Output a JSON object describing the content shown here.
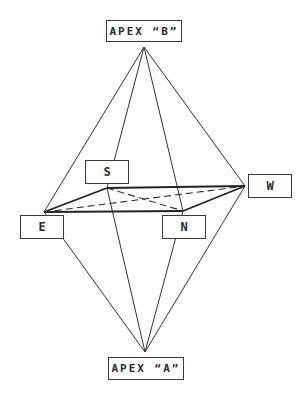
{
  "diagram": {
    "type": "octahedron-bipyramid",
    "line_color": "#333333",
    "apexes": {
      "top": {
        "label": "APEX “B”",
        "point": [
          144,
          47
        ]
      },
      "bottom": {
        "label": "APEX “A”",
        "point": [
          145,
          352
        ]
      }
    },
    "vertices": {
      "S": {
        "label": "S",
        "point": [
          107,
          188
        ]
      },
      "E": {
        "label": "E",
        "point": [
          44,
          212
        ]
      },
      "N": {
        "label": "N",
        "point": [
          183,
          211
        ]
      },
      "W": {
        "label": "W",
        "point": [
          245,
          186
        ]
      }
    },
    "edges": {
      "solid_thick": [
        [
          "E",
          "S"
        ],
        [
          "S",
          "W"
        ],
        [
          "E",
          "N"
        ],
        [
          "N",
          "W"
        ]
      ],
      "dashed": [
        [
          "E",
          "W"
        ],
        [
          "S",
          "N"
        ]
      ],
      "apex_lines": [
        [
          "B",
          "E"
        ],
        [
          "B",
          "S"
        ],
        [
          "B",
          "N"
        ],
        [
          "B",
          "W"
        ],
        [
          "A",
          "E"
        ],
        [
          "A",
          "S"
        ],
        [
          "A",
          "N"
        ],
        [
          "A",
          "W"
        ]
      ]
    }
  }
}
